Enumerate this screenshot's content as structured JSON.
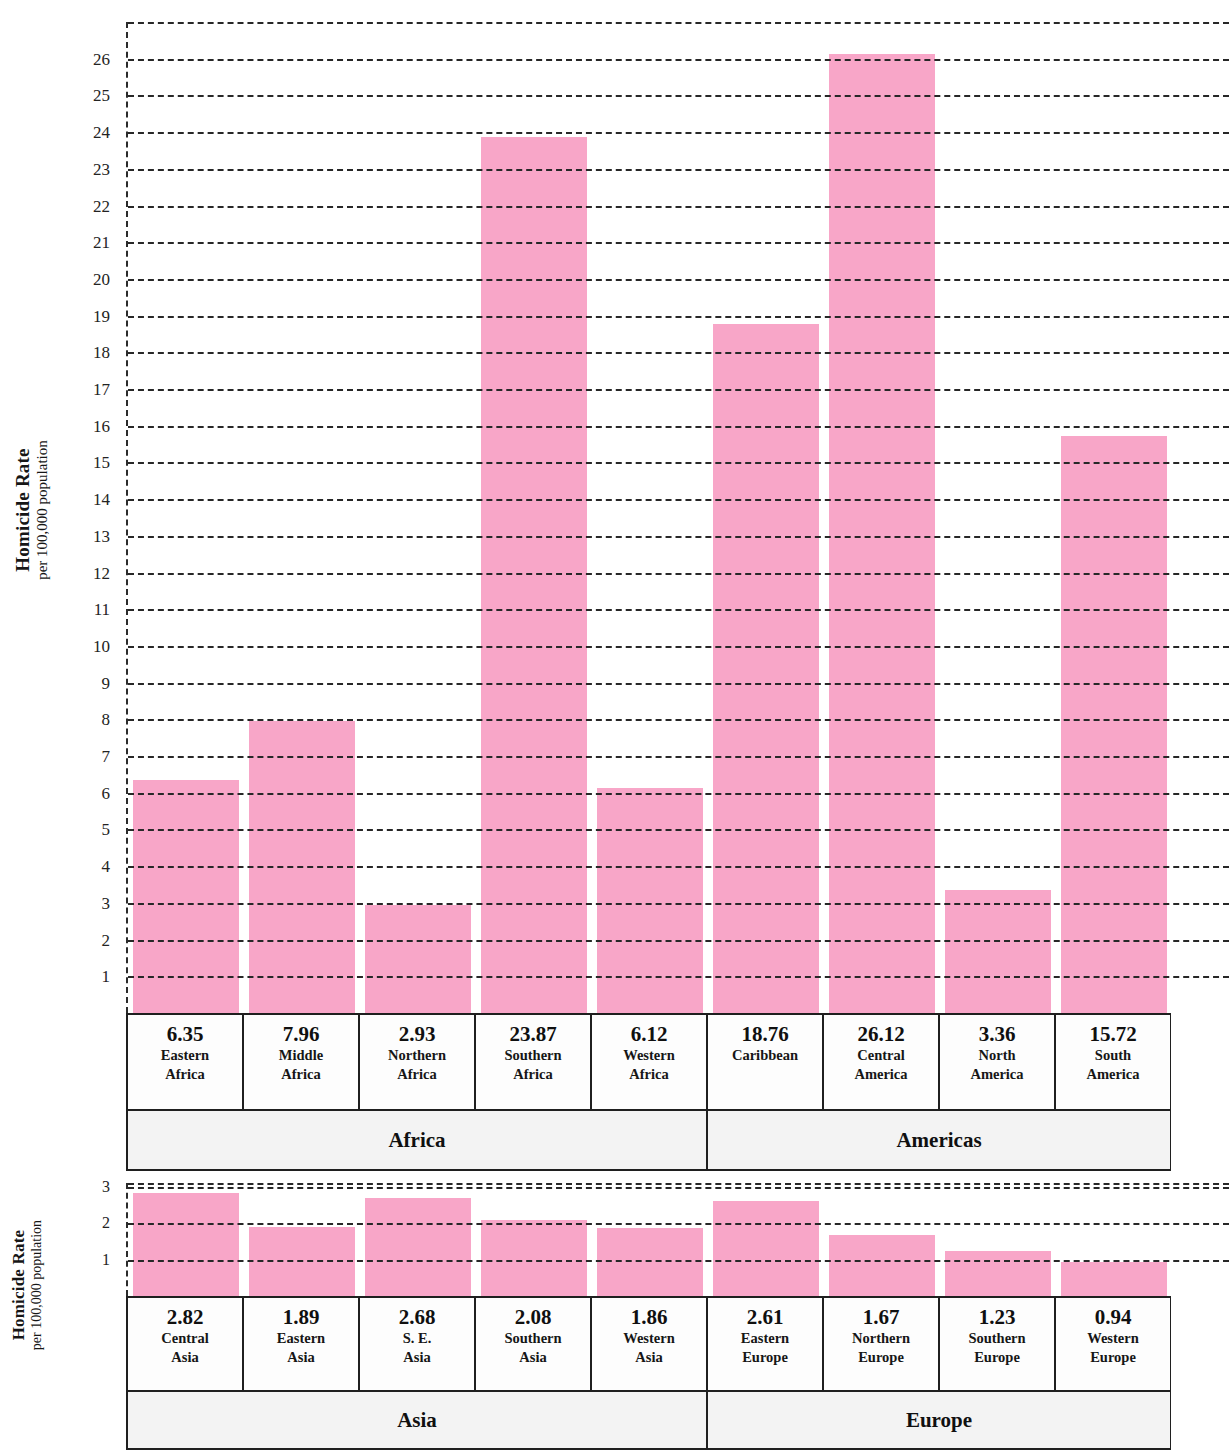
{
  "figure": {
    "bar_color": "#f8a6c8",
    "grid_color": "#272727",
    "axis_title_main": "Homicide Rate",
    "axis_title_sub": "per 100,000 population"
  },
  "chart_data": [
    {
      "type": "bar",
      "title": "",
      "xlabel": "",
      "ylabel": "Homicide Rate per 100,000 population",
      "ylim": [
        0,
        27
      ],
      "grid": true,
      "legend": "none",
      "categories": [
        "Eastern Africa",
        "Middle Africa",
        "Northern Africa",
        "Southern Africa",
        "Western Africa",
        "Caribbean",
        "Central America",
        "North America",
        "South America"
      ],
      "category_lines": [
        [
          "Eastern",
          "Africa"
        ],
        [
          "Middle",
          "Africa"
        ],
        [
          "Northern",
          "Africa"
        ],
        [
          "Southern",
          "Africa"
        ],
        [
          "Western",
          "Africa"
        ],
        [
          "Caribbean",
          ""
        ],
        [
          "Central",
          "America"
        ],
        [
          "North",
          "America"
        ],
        [
          "South",
          "America"
        ]
      ],
      "values": [
        6.35,
        7.96,
        2.93,
        23.87,
        6.12,
        18.76,
        26.12,
        3.36,
        15.72
      ],
      "value_labels": [
        "6.35",
        "7.96",
        "2.93",
        "23.87",
        "6.12",
        "18.76",
        "26.12",
        "3.36",
        "15.72"
      ],
      "yticks": [
        1,
        2,
        3,
        4,
        5,
        6,
        7,
        8,
        9,
        10,
        11,
        12,
        13,
        14,
        15,
        16,
        17,
        18,
        19,
        20,
        21,
        22,
        23,
        24,
        25,
        26
      ],
      "ytick_labels": [
        "1",
        "2",
        "3",
        "4",
        "5",
        "6",
        "7",
        "8",
        "9",
        "10",
        "11",
        "12",
        "13",
        "14",
        "15",
        "16",
        "17",
        "18",
        "19",
        "20",
        "21",
        "22",
        "23",
        "24",
        "25",
        "26"
      ],
      "groups": [
        {
          "label": "Africa",
          "span": 5
        },
        {
          "label": "Americas",
          "span": 4
        }
      ]
    },
    {
      "type": "bar",
      "title": "",
      "xlabel": "",
      "ylabel": "Homicide Rate per 100,000 population",
      "ylim": [
        0,
        3.1
      ],
      "grid": true,
      "legend": "none",
      "categories": [
        "Central Asia",
        "Eastern Asia",
        "S. E. Asia",
        "Southern Asia",
        "Western Asia",
        "Eastern Europe",
        "Northern Europe",
        "Southern Europe",
        "Western Europe"
      ],
      "category_lines": [
        [
          "Central",
          "Asia"
        ],
        [
          "Eastern",
          "Asia"
        ],
        [
          "S. E.",
          "Asia"
        ],
        [
          "Southern",
          "Asia"
        ],
        [
          "Western",
          "Asia"
        ],
        [
          "Eastern",
          "Europe"
        ],
        [
          "Northern",
          "Europe"
        ],
        [
          "Southern",
          "Europe"
        ],
        [
          "Western",
          "Europe"
        ]
      ],
      "values": [
        2.82,
        1.89,
        2.68,
        2.08,
        1.86,
        2.61,
        1.67,
        1.23,
        0.94
      ],
      "value_labels": [
        "2.82",
        "1.89",
        "2.68",
        "2.08",
        "1.86",
        "2.61",
        "1.67",
        "1.23",
        "0.94"
      ],
      "yticks": [
        1,
        2,
        3
      ],
      "ytick_labels": [
        "1",
        "2",
        "3"
      ],
      "groups": [
        {
          "label": "Asia",
          "span": 5
        },
        {
          "label": "Europe",
          "span": 4
        }
      ]
    }
  ]
}
